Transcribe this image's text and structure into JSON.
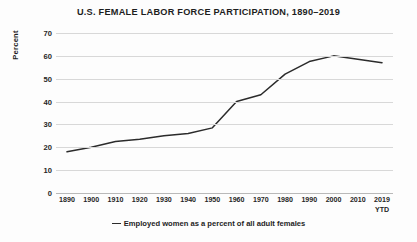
{
  "chart_data": {
    "type": "line",
    "title": "U.S. FEMALE LABOR FORCE PARTICIPATION, 1890–2019",
    "xlabel": "",
    "ylabel": "Percent",
    "ylim": [
      0,
      70
    ],
    "yticks": [
      0,
      10,
      20,
      30,
      40,
      50,
      60,
      70
    ],
    "grid": true,
    "legend_position": "bottom",
    "categories": [
      "1890",
      "1900",
      "1910",
      "1920",
      "1930",
      "1940",
      "1950",
      "1960",
      "1970",
      "1980",
      "1990",
      "2000",
      "2010",
      "2019 YTD"
    ],
    "category_lines": [
      [
        "1890"
      ],
      [
        "1900"
      ],
      [
        "1910"
      ],
      [
        "1920"
      ],
      [
        "1930"
      ],
      [
        "1940"
      ],
      [
        "1950"
      ],
      [
        "1960"
      ],
      [
        "1970"
      ],
      [
        "1980"
      ],
      [
        "1990"
      ],
      [
        "2000"
      ],
      [
        "2010"
      ],
      [
        "2019",
        "YTD"
      ]
    ],
    "series": [
      {
        "name": "Employed women as a percent of all adult females",
        "color": "#2b2b2b",
        "values": [
          18,
          20,
          22.5,
          23.5,
          25,
          26,
          28.5,
          40,
          43,
          52,
          57.5,
          60,
          58.5,
          57
        ]
      }
    ],
    "legend": [
      "Employed women as a percent of all adult females"
    ]
  },
  "colors": {
    "background": "#fdfdfd",
    "gridline": "#d8d8d8",
    "axis": "#b9b9b9",
    "text": "#1d1d1d",
    "line": "#2b2b2b"
  }
}
